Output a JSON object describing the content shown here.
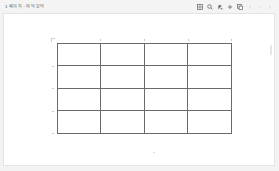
{
  "window": {
    "title": "1 페이지 - 여덕 모덕"
  },
  "toolbar": {
    "icons": [
      {
        "name": "table-icon",
        "enabled": true
      },
      {
        "name": "search-icon",
        "enabled": true
      },
      {
        "name": "paint-icon",
        "enabled": true
      },
      {
        "name": "add-icon",
        "enabled": true
      },
      {
        "name": "copy-icon",
        "enabled": true
      },
      {
        "name": "undo-icon",
        "enabled": false
      },
      {
        "name": "redo-icon",
        "enabled": false
      },
      {
        "name": "more-icon",
        "enabled": false
      }
    ]
  },
  "canvas": {
    "table": {
      "rows": 4,
      "columns": 4,
      "cells": [
        [
          "",
          "",
          "",
          ""
        ],
        [
          "",
          "",
          "",
          ""
        ],
        [
          "",
          "",
          "",
          ""
        ],
        [
          "",
          "",
          "",
          ""
        ]
      ]
    }
  },
  "colors": {
    "background": "#f3f3f3",
    "canvas": "#ffffff",
    "grid_line": "#6a6a6a"
  }
}
